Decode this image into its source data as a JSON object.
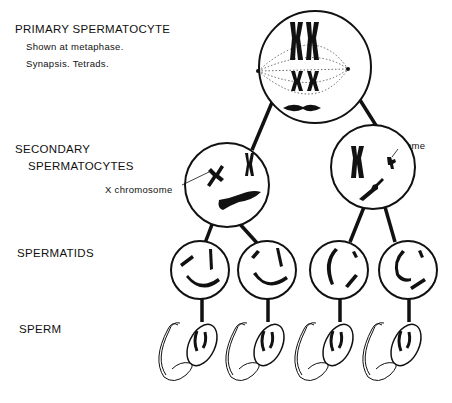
{
  "labels": {
    "primary_title": "PRIMARY SPERMATOCYTE",
    "primary_note_1": "Shown at metaphase.",
    "primary_note_2": "Synapsis. Tetrads.",
    "secondary_line_1": "SECONDARY",
    "secondary_line_2": "SPERMATOCYTES",
    "spermatids": "SPERMATIDS",
    "sperm": "SPERM",
    "x_chromosome": "X chromosome",
    "y_chromosome": "Y chromosome"
  },
  "stages": [
    {
      "name": "Primary spermatocyte",
      "count": 1
    },
    {
      "name": "Secondary spermatocytes",
      "count": 2
    },
    {
      "name": "Spermatids",
      "count": 4
    },
    {
      "name": "Sperm",
      "count": 4
    }
  ],
  "colors": {
    "ink": "#111111",
    "background": "#ffffff"
  }
}
